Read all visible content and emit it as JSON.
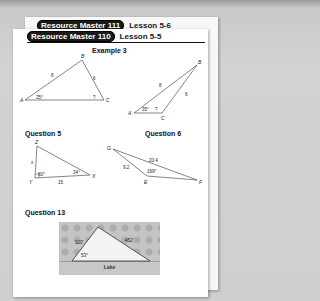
{
  "back_page": {
    "badge": "Resource Master 111",
    "lesson": "Lesson 5-6"
  },
  "front_page": {
    "badge": "Resource Master 110",
    "lesson": "Lesson 5-5",
    "sections": {
      "example3": {
        "title": "Example 3",
        "triangle1": {
          "vertices": [
            "A",
            "B",
            "C"
          ],
          "side_AB": "8",
          "side_BC": "6",
          "angle_A": "35°",
          "angle_C": "?"
        },
        "triangle2": {
          "vertices": [
            "A",
            "B",
            "C"
          ],
          "side_AB": "8",
          "side_BC": "6",
          "angle_A": "35°",
          "angle_C": "?"
        }
      },
      "question5": {
        "title": "Question 5",
        "vertices": [
          "Z",
          "Y",
          "X"
        ],
        "side_ZY": "x",
        "side_YX": "15",
        "angle_Y": "80°",
        "angle_X": "34°"
      },
      "question6": {
        "title": "Question 6",
        "vertices": [
          "G",
          "E",
          "F"
        ],
        "side_GE": "9.2",
        "side_GF": "20.4",
        "angle_E": "169°"
      },
      "question13": {
        "title": "Question 13",
        "side_left": "320'",
        "side_right": "452'",
        "angle": "53°",
        "caption": "Lake"
      }
    }
  }
}
